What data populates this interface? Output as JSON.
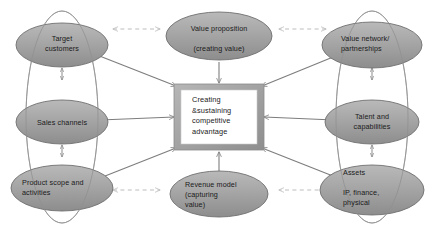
{
  "diagram": {
    "center": {
      "name": "competitive-advantage",
      "text": "Creating\n&sustaining\ncompetitive\nadvantage",
      "frame_color": "#a3a3a3",
      "panel_color": "#ffffff"
    },
    "nodes": [
      {
        "id": "target-customers",
        "label": "Target\ncustomers",
        "group": "left"
      },
      {
        "id": "sales-channels",
        "label": "Sales channels",
        "group": "left"
      },
      {
        "id": "product-scope",
        "label": "Product scope and\nactivities",
        "group": "left"
      },
      {
        "id": "value-proposition",
        "label": "Value proposition\n\n(creating value)",
        "group": "top"
      },
      {
        "id": "revenue-model",
        "label": "Revenue model\n(capturing\nvalue)",
        "group": "bottom"
      },
      {
        "id": "value-network",
        "label": "Value network/\npartnerships",
        "group": "right"
      },
      {
        "id": "talent-capabilities",
        "label": "Talent and\ncapabilities",
        "group": "right"
      },
      {
        "id": "assets",
        "label": "Assets\n\nIP, finance,\nphysical",
        "group": "right"
      }
    ],
    "colors": {
      "ellipse_fill_light": "#bcbcbc",
      "ellipse_fill_dark": "#8f8f8f",
      "ellipse_stroke": "#6f6f6f",
      "arrow_solid": "#7d7d7d",
      "arrow_dashed": "#bdbdbd",
      "group_outline": "#9c9c9c",
      "text": "#1a1a1a"
    },
    "connectors": {
      "solid_into_center": 8,
      "dashed_horizontal": 4,
      "vertical_double_arrows": 4
    }
  }
}
